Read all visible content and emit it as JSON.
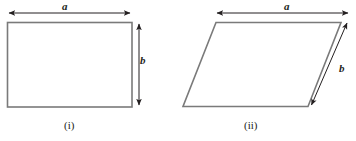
{
  "figure": {
    "background_color": "#ffffff",
    "stroke_color": "#7a7a7a",
    "arrow_color": "#231f20",
    "text_color": "#231f20",
    "figures": [
      {
        "id": "rectangle",
        "caption": "(i)",
        "shape": "rectangle",
        "dimension_labels": {
          "width_label": "a",
          "height_label": "b"
        },
        "geometry": {
          "top_left": [
            7,
            22
          ],
          "top_right": [
            132,
            22
          ],
          "bottom_right": [
            132,
            107
          ],
          "bottom_left": [
            7,
            107
          ]
        },
        "width_arrow": {
          "x1": 8,
          "y1": 13,
          "x2": 131,
          "y2": 13
        },
        "height_arrow": {
          "x1": 139,
          "y1": 23,
          "x2": 139,
          "y2": 106
        }
      },
      {
        "id": "parallelogram",
        "caption": "(ii)",
        "shape": "parallelogram",
        "dimension_labels": {
          "width_label": "a",
          "side_label": "b"
        },
        "geometry": {
          "top_left": [
            216,
            22
          ],
          "top_right": [
            341,
            22
          ],
          "bottom_right": [
            308,
            107
          ],
          "bottom_left": [
            183,
            107
          ]
        },
        "width_arrow": {
          "x1": 216,
          "y1": 13,
          "x2": 349,
          "y2": 13
        },
        "side_arrow": {
          "x1": 311,
          "y1": 107,
          "x2": 348,
          "y2": 21
        }
      }
    ]
  },
  "labels": {
    "a_rect": "a",
    "b_rect": "b",
    "a_par": "a",
    "b_par": "b"
  },
  "captions": {
    "i": "(i)",
    "ii": "(ii)"
  }
}
